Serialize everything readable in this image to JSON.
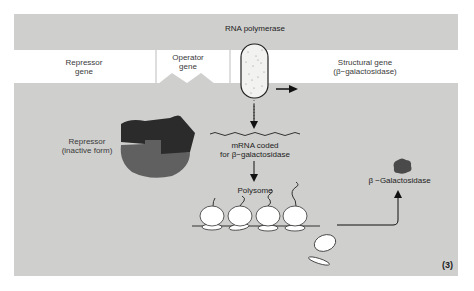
{
  "diagram": {
    "panel_number": "(3)",
    "colors": {
      "background": "#cfcfcd",
      "gene_band": "#ffffff",
      "repressor_top": "#2a2a2a",
      "repressor_bottom": "#5f5f5f",
      "enzyme": "#4a4a4a",
      "lines": "#222222"
    },
    "gene_band": {
      "segments": [
        {
          "id": "repressor-gene",
          "label_line1": "Repressor",
          "label_line2": "gene"
        },
        {
          "id": "operator-gene",
          "label_line1": "Operator",
          "label_line2": "gene"
        },
        {
          "id": "structural-gene",
          "label_line1": "Structural gene",
          "label_line2": "(β−galactosidase)"
        }
      ]
    },
    "rna_polymerase": {
      "label": "RNA polymerase"
    },
    "repressor": {
      "label_line1": "Repressor",
      "label_line2": "(inactive form)"
    },
    "mrna": {
      "label_line1": "mRNA coded",
      "label_line2": "for β−galactosidase"
    },
    "polysome": {
      "label": "Polysome",
      "ribosome_count": 4
    },
    "product": {
      "label": "β −Galactosidase"
    },
    "nodes": [
      "Repressor gene",
      "Operator gene",
      "Structural gene",
      "RNA polymerase",
      "Repressor (inactive form)",
      "mRNA",
      "Polysome",
      "β-Galactosidase"
    ],
    "edges": [
      {
        "from": "RNA polymerase",
        "to": "Structural gene",
        "label": "transcription direction"
      },
      {
        "from": "RNA polymerase",
        "to": "mRNA"
      },
      {
        "from": "mRNA",
        "to": "Polysome"
      },
      {
        "from": "Polysome",
        "to": "β-Galactosidase"
      }
    ]
  }
}
